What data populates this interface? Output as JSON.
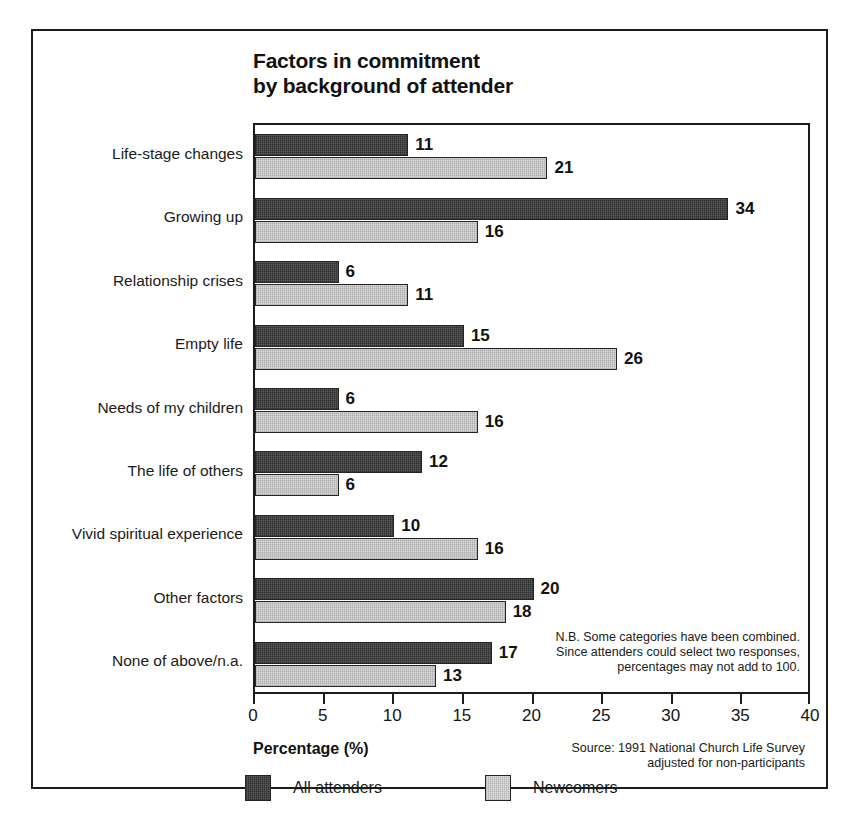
{
  "chart_data": {
    "type": "bar",
    "orientation": "horizontal",
    "title": "Factors in commitment by background of attender",
    "title_lines": [
      "Factors in commitment",
      "by background of attender"
    ],
    "xlabel": "Percentage (%)",
    "ylabel": "",
    "xlim": [
      0,
      40
    ],
    "xticks": [
      0,
      5,
      10,
      15,
      20,
      25,
      30,
      35,
      40
    ],
    "xtick_labels": [
      "0",
      "5",
      "10",
      "15",
      "20",
      "25",
      "30",
      "35",
      "40"
    ],
    "grid": false,
    "legend_position": "bottom",
    "categories": [
      "Life-stage changes",
      "Growing up",
      "Relationship crises",
      "Empty life",
      "Needs of my children",
      "The life of others",
      "Vivid spiritual experience",
      "Other factors",
      "None of above/n.a."
    ],
    "series": [
      {
        "name": "All attenders",
        "color": "#5b5b5b",
        "values": [
          11,
          34,
          6,
          15,
          6,
          12,
          10,
          20,
          17
        ],
        "value_labels": [
          "11",
          "34",
          "6",
          "15",
          "6",
          "12",
          "10",
          "20",
          "17"
        ]
      },
      {
        "name": "Newcomers",
        "color": "#d9d9d9",
        "values": [
          21,
          16,
          11,
          26,
          16,
          6,
          16,
          18,
          13
        ],
        "value_labels": [
          "21",
          "16",
          "11",
          "26",
          "16",
          "6",
          "16",
          "18",
          "13"
        ]
      }
    ],
    "annotations": {
      "footnote_lines": [
        "N.B. Some categories have been combined.",
        "Since attenders could select two responses,",
        "percentages may not add to 100."
      ],
      "source_lines": [
        "Source: 1991 National Church Life Survey",
        "adjusted for non-participants"
      ]
    }
  }
}
